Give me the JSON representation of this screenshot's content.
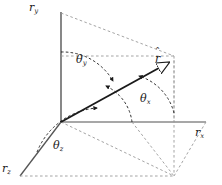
{
  "figure": {
    "type": "vector-direction-angles-diagram",
    "background_color": "#ffffff",
    "stroke_color": "#1a1a1a",
    "axis_color": "#6b6b6b",
    "dash_color": "#8a8a8a",
    "axes": [
      {
        "id": "x",
        "label_base": "r",
        "label_sub": "x",
        "direction": "right"
      },
      {
        "id": "y",
        "label_base": "r",
        "label_sub": "y",
        "direction": "up"
      },
      {
        "id": "z",
        "label_base": "r",
        "label_sub": "z",
        "direction": "down-left"
      }
    ],
    "vector": {
      "label_base": "r",
      "accent": "̂",
      "name": "unit-vector-r-hat",
      "origin": [
        61,
        122
      ],
      "tip": [
        173,
        60
      ]
    },
    "angles": [
      {
        "id": "theta-x",
        "symbol": "θ",
        "sub": "x",
        "measured_from": "r_x axis"
      },
      {
        "id": "theta-y",
        "symbol": "θ",
        "sub": "y",
        "measured_from": "r_y axis"
      },
      {
        "id": "theta-z",
        "symbol": "θ",
        "sub": "z",
        "measured_from": "r_z axis"
      }
    ]
  },
  "labels": {
    "axis_x_base": "r",
    "axis_x_sub": "x",
    "axis_y_base": "r",
    "axis_y_sub": "y",
    "axis_z_base": "r",
    "axis_z_sub": "z",
    "theta_x_base": "θ",
    "theta_x_sub": "x",
    "theta_y_base": "θ",
    "theta_y_sub": "y",
    "theta_z_base": "θ",
    "theta_z_sub": "z",
    "vector_base": "r",
    "vector_hat": "ˆ"
  }
}
